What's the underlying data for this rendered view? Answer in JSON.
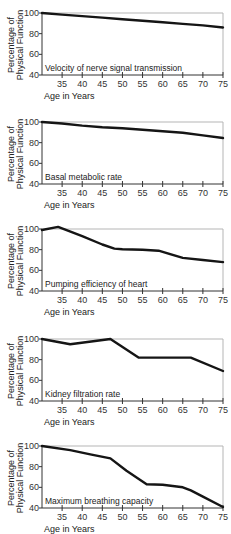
{
  "common": {
    "ylabel_line1": "Percentage of",
    "ylabel_line2": "Physical Function",
    "xlabel": "Age in Years",
    "y_ticks": [
      100,
      80,
      60,
      40
    ],
    "x_ticks": [
      35,
      40,
      45,
      50,
      55,
      60,
      65,
      70,
      75
    ]
  },
  "chart_data": [
    {
      "type": "line",
      "title": "Velocity of nerve signal transmission",
      "xlabel": "Age in Years",
      "ylabel": "Percentage of Physical Function",
      "xlim": [
        30,
        75
      ],
      "ylim": [
        40,
        100
      ],
      "x": [
        30,
        35,
        40,
        45,
        50,
        55,
        60,
        65,
        70,
        75
      ],
      "y": [
        100,
        98.5,
        97,
        95.5,
        94,
        92.5,
        91,
        89.5,
        88,
        86
      ]
    },
    {
      "type": "line",
      "title": "Basal metabolic rate",
      "xlabel": "Age in Years",
      "ylabel": "Percentage of Physical Function",
      "xlim": [
        30,
        75
      ],
      "ylim": [
        40,
        100
      ],
      "x": [
        30,
        35,
        40,
        45,
        50,
        55,
        60,
        65,
        70,
        75
      ],
      "y": [
        100,
        98.5,
        96.5,
        95,
        94,
        92.5,
        91,
        89.5,
        87,
        84.5
      ]
    },
    {
      "type": "line",
      "title": "Pumping efficiency of heart",
      "xlabel": "Age in Years",
      "ylabel": "Percentage of Physical Function",
      "xlim": [
        30,
        75
      ],
      "ylim": [
        40,
        100
      ],
      "x": [
        30,
        34,
        40,
        45,
        48,
        50,
        55,
        59,
        65,
        70,
        75
      ],
      "y": [
        99,
        102,
        93,
        85,
        81,
        80.5,
        80,
        79,
        72,
        70,
        68
      ]
    },
    {
      "type": "line",
      "title": "Kidney filtration rate",
      "xlabel": "Age in Years",
      "ylabel": "Percentage of Physical Function",
      "xlim": [
        30,
        75
      ],
      "ylim": [
        40,
        100
      ],
      "x": [
        30,
        37,
        47,
        54,
        67,
        75
      ],
      "y": [
        100,
        95,
        100,
        82,
        82,
        69
      ]
    },
    {
      "type": "line",
      "title": "Maximum breathing capacity",
      "xlabel": "Age in Years",
      "ylabel": "Percentage of Physical Function",
      "xlim": [
        30,
        75
      ],
      "ylim": [
        40,
        100
      ],
      "x": [
        30,
        37,
        42,
        47,
        51,
        56,
        60,
        65,
        67,
        70,
        75
      ],
      "y": [
        100,
        96,
        92,
        88,
        76,
        63,
        62.5,
        60,
        57,
        51,
        41
      ]
    }
  ]
}
